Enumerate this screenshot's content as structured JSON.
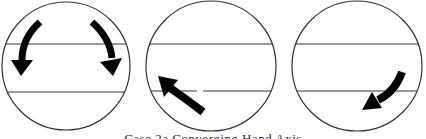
{
  "figure": {
    "panels": [
      {
        "id": "panel-1",
        "arrows": [
          "curved-arrow-down-left",
          "curved-arrow-down-right"
        ]
      },
      {
        "id": "panel-2",
        "arrows": [
          "curved-arrow-up-left"
        ]
      },
      {
        "id": "panel-3",
        "arrows": [
          "curved-arrow-down-left"
        ]
      }
    ],
    "caption": "Case 2a  Converging Hand Axis"
  }
}
